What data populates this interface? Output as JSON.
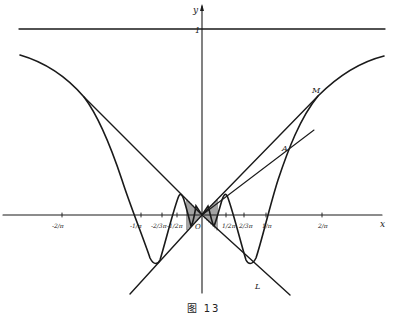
{
  "figure": {
    "caption": "图  13",
    "axis_labels": {
      "x": "x",
      "y": "y"
    },
    "origin_label": "O",
    "asymptote_label": "1",
    "point_labels": {
      "M": "M",
      "A": "A",
      "L": "L"
    },
    "x_ticks_negative": [
      "-2/π",
      "-1/π",
      "-2/3π",
      "-1/2π"
    ],
    "x_ticks_positive": [
      "1/2π",
      "2/3π",
      "1/π",
      "2/π"
    ],
    "colors": {
      "ink": "#1a1a1a",
      "background": "#ffffff"
    }
  }
}
